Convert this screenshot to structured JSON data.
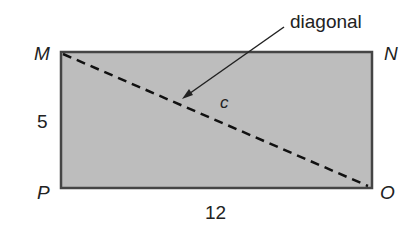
{
  "diagram": {
    "vertices": {
      "top_left": "M",
      "top_right": "N",
      "bottom_left": "P",
      "bottom_right": "O"
    },
    "side_left": "5",
    "side_bottom": "12",
    "diagonal_label": "c",
    "callout": "diagonal",
    "colors": {
      "fill": "#bdbdbd",
      "stroke": "#454545",
      "background": "#ffffff"
    }
  }
}
